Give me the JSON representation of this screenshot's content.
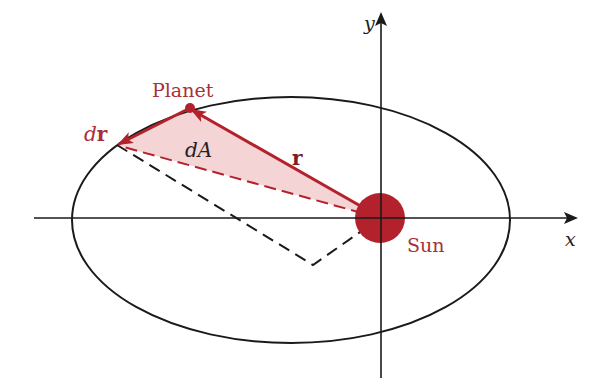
{
  "figure": {
    "labels": {
      "y_axis": "y",
      "x_axis": "x",
      "planet": "Planet",
      "sun": "Sun",
      "position_vector": "r",
      "dr_prefix": "d",
      "dr_vector": "r",
      "area_element": "dA"
    },
    "colors": {
      "accent_red": "#b3222c",
      "label_red": "#a8303a",
      "area_fill": "#f3cfcf",
      "line_black": "#1a1a1a"
    },
    "geometry": {
      "ellipse": {
        "cx": 291,
        "cy": 220,
        "rx": 219,
        "ry": 123
      },
      "sun": {
        "cx": 380,
        "cy": 218,
        "r": 25
      },
      "planet": {
        "cx": 190,
        "cy": 108,
        "r": 5
      },
      "dr_tip": {
        "x": 117,
        "y": 145
      },
      "right_angle_corner": {
        "x": 313,
        "y": 265
      },
      "x_axis": {
        "x1": 34,
        "x2": 578,
        "y": 218
      },
      "y_axis": {
        "x": 381,
        "y1": 12,
        "y2": 378
      }
    }
  }
}
